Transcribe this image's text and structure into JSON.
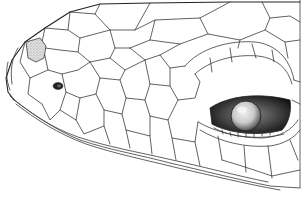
{
  "figure": {
    "colors": {
      "background": "#ffffff",
      "line": "#3a3a3a",
      "stipple_fill": "#c8c8c8",
      "eye_dark": "#1a1a1a",
      "eye_highlight": "#e6e6e6"
    },
    "features": [
      {
        "name": "stippled-nasal-scale",
        "x": 32,
        "y": 53
      },
      {
        "name": "nostril",
        "x": 58,
        "y": 86
      },
      {
        "name": "eye",
        "x": 268,
        "y": 118
      },
      {
        "name": "cropped-frame-right-edge",
        "x": 300
      }
    ]
  }
}
